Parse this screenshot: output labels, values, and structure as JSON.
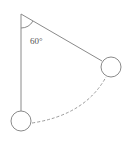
{
  "diagram": {
    "type": "pendulum",
    "angle_label": "60°",
    "angle_degrees": 60,
    "elements": [
      "pivot",
      "vertical-string",
      "displaced-string",
      "bob-rest",
      "bob-displaced",
      "swing-arc",
      "angle-arc"
    ],
    "colors": {
      "stroke": "#8a8a8a",
      "dash": "#9a9a9a",
      "label": "#555555"
    }
  }
}
